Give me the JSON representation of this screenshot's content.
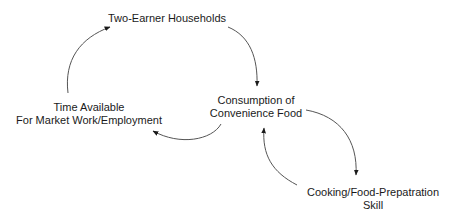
{
  "diagram": {
    "type": "causal-loop",
    "nodes": [
      {
        "id": "two-earner",
        "lines": [
          "Two-Earner Households"
        ]
      },
      {
        "id": "consumption",
        "lines": [
          "Consumption of",
          "Convenience Food"
        ]
      },
      {
        "id": "time-available",
        "lines": [
          "Time Available",
          "For Market Work/Employment"
        ]
      },
      {
        "id": "cooking-skill",
        "lines": [
          "Cooking/Food-Prepatration",
          "Skill"
        ]
      }
    ],
    "edges": [
      {
        "from": "two-earner",
        "to": "consumption"
      },
      {
        "from": "consumption",
        "to": "time-available"
      },
      {
        "from": "time-available",
        "to": "two-earner"
      },
      {
        "from": "consumption",
        "to": "cooking-skill"
      },
      {
        "from": "cooking-skill",
        "to": "consumption"
      }
    ],
    "colors": {
      "text": "#1a1a1a",
      "edge": "#555555",
      "background": "#ffffff"
    }
  }
}
